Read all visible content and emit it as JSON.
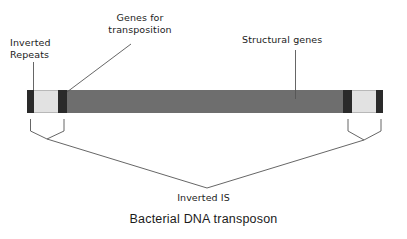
{
  "diagram": {
    "title": "Bacterial DNA transposon",
    "labels": {
      "inverted_repeats": "Inverted\nRepeats",
      "genes_for_transposition": "Genes for\ntransposition",
      "structural_genes": "Structural genes",
      "inverted_is": "Inverted IS"
    },
    "colors": {
      "terminal_dark": "#2a2a2a",
      "inverted_repeat_light": "#e2e2e2",
      "body_gray": "#6e6e6e",
      "line": "#555555",
      "text": "#1b1b1b",
      "background": "#ffffff"
    },
    "structure": {
      "bar_segments": [
        {
          "name": "left-terminal-dark",
          "kind": "dark",
          "width_px": 7
        },
        {
          "name": "left-inverted-repeat",
          "kind": "light",
          "width_px": 24
        },
        {
          "name": "left-transposition-genes-dark",
          "kind": "dark",
          "width_px": 9
        },
        {
          "name": "structural-genes-body",
          "kind": "body",
          "width_px": 276
        },
        {
          "name": "right-transposition-genes-dark",
          "kind": "dark",
          "width_px": 9
        },
        {
          "name": "right-inverted-repeat",
          "kind": "light",
          "width_px": 24
        },
        {
          "name": "right-terminal-dark",
          "kind": "dark",
          "width_px": 7
        }
      ]
    }
  }
}
